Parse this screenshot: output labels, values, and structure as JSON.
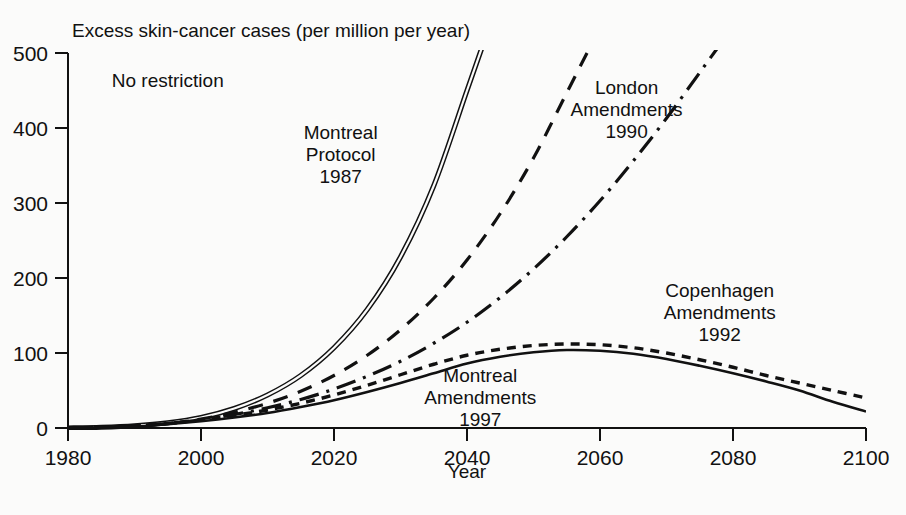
{
  "chart_data": {
    "type": "line",
    "title": "Excess skin-cancer cases (per million per year)",
    "xlabel": "Year",
    "ylabel": "",
    "xlim": [
      1980,
      2100
    ],
    "ylim": [
      0,
      500
    ],
    "grid": false,
    "legend_position": "inline-annotations",
    "xticks": [
      "1980",
      "2000",
      "2020",
      "2040",
      "2060",
      "2080",
      "2100"
    ],
    "yticks": [
      "0",
      "100",
      "200",
      "300",
      "400",
      "500"
    ],
    "x": [
      1980,
      1985,
      1990,
      1995,
      2000,
      2005,
      2010,
      2015,
      2020,
      2025,
      2030,
      2035,
      2040,
      2045,
      2050,
      2055,
      2060,
      2065,
      2070,
      2075,
      2080,
      2085,
      2090,
      2095,
      2100
    ],
    "series": [
      {
        "name": "No restriction",
        "label": "No restriction",
        "style": "double-solid",
        "label_x": 1995,
        "label_y": 455,
        "values": [
          0,
          1,
          3,
          7,
          14,
          26,
          44,
          70,
          107,
          158,
          228,
          323,
          450,
          null,
          null,
          null,
          null,
          null,
          null,
          null,
          null,
          null,
          null,
          null,
          null
        ]
      },
      {
        "name": "Montreal Protocol 1987",
        "label": "Montreal\nProtocol\n1987",
        "style": "dashed",
        "label_x": 2021,
        "label_y": 385,
        "values": [
          0,
          1,
          3,
          6,
          12,
          21,
          33,
          49,
          70,
          97,
          131,
          173,
          224,
          286,
          360,
          447,
          null,
          null,
          null,
          null,
          null,
          null,
          null,
          null,
          null
        ]
      },
      {
        "name": "London Amendments 1990",
        "label": "London\nAmendments\n1990",
        "style": "dash-dot",
        "label_x": 2064,
        "label_y": 445,
        "values": [
          0,
          1,
          3,
          6,
          11,
          18,
          27,
          38,
          52,
          69,
          89,
          113,
          141,
          174,
          212,
          255,
          303,
          356,
          413,
          474,
          null,
          null,
          null,
          null,
          null
        ]
      },
      {
        "name": "Copenhagen Amendments 1992",
        "label": "Copenhagen\nAmendments\n1992",
        "style": "dotted",
        "label_x": 2078,
        "label_y": 175,
        "values": [
          0,
          1,
          3,
          6,
          11,
          17,
          24,
          33,
          44,
          57,
          71,
          85,
          97,
          105,
          110,
          112,
          111,
          107,
          100,
          91,
          81,
          70,
          60,
          50,
          40
        ]
      },
      {
        "name": "Montreal Amendments 1997",
        "label": "Montreal\nAmendments\n1997",
        "style": "solid",
        "label_x": 2042,
        "label_y": 62,
        "values": [
          0,
          1,
          2,
          5,
          9,
          14,
          20,
          28,
          37,
          48,
          60,
          73,
          86,
          95,
          101,
          104,
          103,
          99,
          92,
          83,
          73,
          62,
          50,
          35,
          22
        ]
      }
    ]
  },
  "page": {
    "background_color": "#fbfbfa",
    "ink_color": "#111111"
  }
}
